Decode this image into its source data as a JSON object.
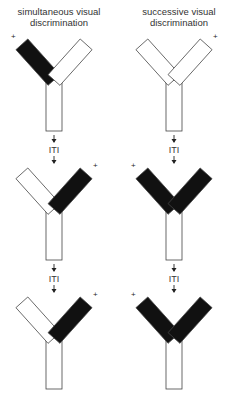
{
  "columns": [
    {
      "title": "simultaneous visual discrimination",
      "trials": [
        {
          "left_arm": "black",
          "right_arm": "white",
          "reward": "left",
          "plus": "+"
        },
        {
          "left_arm": "white",
          "right_arm": "black",
          "reward": "right",
          "plus": "+"
        },
        {
          "left_arm": "white",
          "right_arm": "black",
          "reward": "right",
          "plus": "+"
        }
      ]
    },
    {
      "title": "successive visual discrimination",
      "trials": [
        {
          "left_arm": "white",
          "right_arm": "white",
          "reward": "right",
          "plus": "+"
        },
        {
          "left_arm": "black",
          "right_arm": "black",
          "reward": "left",
          "plus": "+"
        },
        {
          "left_arm": "black",
          "right_arm": "black",
          "reward": "left",
          "plus": "+"
        }
      ]
    }
  ],
  "interval_label": "ITI",
  "colors": {
    "black": "#111111",
    "white": "#ffffff",
    "stroke": "#444444"
  }
}
